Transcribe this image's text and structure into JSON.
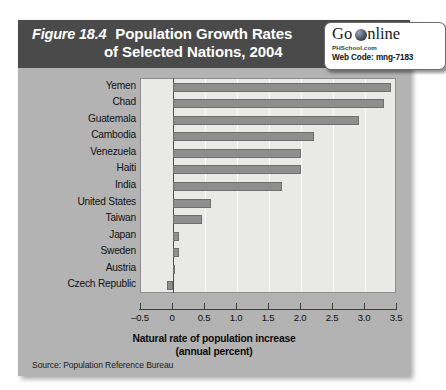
{
  "figure": {
    "number": "Figure 18.4",
    "title_line1": "Population Growth Rates",
    "title_line2": "of Selected Nations, 2004",
    "source": "Source:  Population Reference Bureau"
  },
  "badge": {
    "brand_go": "Go",
    "brand_nline": "nline",
    "globe_icon": "globe-icon",
    "site": "PHSchool.com",
    "web_code": "Web Code: mng-7183"
  },
  "colors": {
    "panel_bg": "#b3b3b3",
    "banner_bg": "#4a4a4a",
    "plot_bg": "#e9e9e7",
    "bar_fill": "#8e8e8e",
    "bar_stroke": "#6f6f6f",
    "gridline": "#ffffff",
    "axis": "#3f3f3f",
    "text": "#111111"
  },
  "chart_data": {
    "type": "bar",
    "orientation": "horizontal",
    "title": "Figure 18.4 Population Growth Rates of Selected Nations, 2004",
    "categories": [
      "Yemen",
      "Chad",
      "Guatemala",
      "Cambodia",
      "Venezuela",
      "Haiti",
      "India",
      "United States",
      "Taiwan",
      "Japan",
      "Sweden",
      "Austria",
      "Czech Republic"
    ],
    "values": [
      3.4,
      3.3,
      2.9,
      2.2,
      2.0,
      2.0,
      1.7,
      0.6,
      0.45,
      0.1,
      0.1,
      0.02,
      -0.1
    ],
    "xlabel": "Natural rate of population increase (annual percent)",
    "xlabel_line1": "Natural rate of population increase",
    "xlabel_line2": "(annual percent)",
    "ylabel": "",
    "xlim": [
      -0.5,
      3.5
    ],
    "xticks": [
      -0.5,
      0,
      0.5,
      1.0,
      1.5,
      2.0,
      2.5,
      3.0,
      3.5
    ],
    "xtick_labels": [
      "–0.5",
      "0",
      "0.5",
      "1.0",
      "1.5",
      "2.0",
      "2.5",
      "3.0",
      "3.5"
    ],
    "grid": true,
    "grid_axis": "x",
    "legend": false,
    "source": "Population Reference Bureau"
  }
}
